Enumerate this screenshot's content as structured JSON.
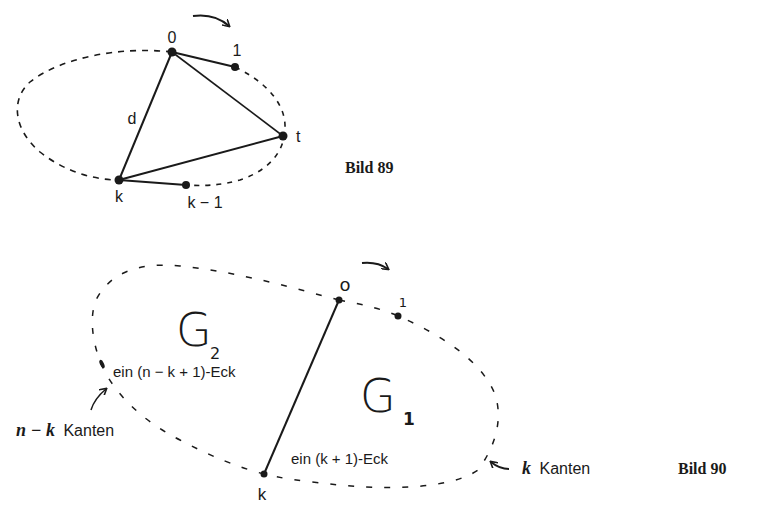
{
  "figure89": {
    "caption": "Bild 89",
    "vertices": {
      "v0": "0",
      "v1": "1",
      "vt": "t",
      "vk": "k",
      "vk1": "k − 1"
    },
    "edge_label": "d",
    "rotation_arrow": "clockwise-arrow"
  },
  "figure90": {
    "caption": "Bild 90",
    "vertices": {
      "v0": "o",
      "v1": "1",
      "vk": "k"
    },
    "regions": {
      "g2_letter": "G",
      "g2_sub": "2",
      "g2_desc": "ein (n − k + 1)-Eck",
      "g1_letter": "G",
      "g1_sub": "1",
      "g1_desc": "ein (k + 1)-Eck"
    },
    "annotations": {
      "left_var": "n − k",
      "left_word": "Kanten",
      "right_var": "k",
      "right_word": "Kanten"
    },
    "rotation_arrow": "clockwise-arrow"
  },
  "colors": {
    "ink": "#1a1a1a",
    "background": "#ffffff"
  }
}
